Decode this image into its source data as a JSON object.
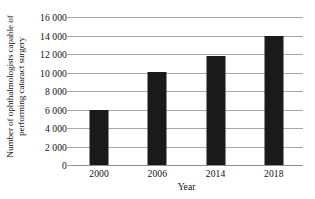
{
  "chart_data": {
    "type": "bar",
    "title": "",
    "xlabel": "Year",
    "ylabel_lines": [
      "Number of ophthalmologists capable of",
      "performing cataract surgery"
    ],
    "ylabel": "Number of ophthalmologists capable of performing cataract surgery",
    "categories": [
      "2000",
      "2006",
      "2014",
      "2018"
    ],
    "values": [
      6000,
      10100,
      11800,
      13900
    ],
    "ylim": [
      0,
      16000
    ],
    "ytick_values": [
      0,
      2000,
      4000,
      6000,
      8000,
      10000,
      12000,
      14000,
      16000
    ],
    "ytick_labels": [
      "0",
      "2 000",
      "4 000",
      "6 000",
      "8 000",
      "10 000",
      "12 000",
      "14 000",
      "16 000"
    ],
    "grid": true,
    "legend": null,
    "bar_color": "#1a1a1a",
    "gridline_color": "#a8a8a8",
    "background_color": "#ffffff"
  }
}
